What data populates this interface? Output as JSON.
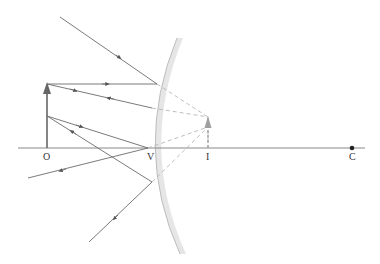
{
  "diagram": {
    "labels": {
      "object": "O",
      "vertex": "V",
      "image": "I",
      "center": "C"
    },
    "colors": {
      "ray": "#6b6b6b",
      "virtual_ray": "#b5b5b5",
      "mirror": "#e4e4e4",
      "mirror_edge": "#b0b0b0",
      "object_arrow": "#666666",
      "image_arrow": "#9a9a9a",
      "center_dot": "#222222"
    },
    "elements": {
      "principal_axis": "principal-axis",
      "mirror": "convex-mirror",
      "object_arrow": "object-arrow (real, upright)",
      "image_arrow": "image-arrow (virtual, upright, diminished)"
    }
  }
}
